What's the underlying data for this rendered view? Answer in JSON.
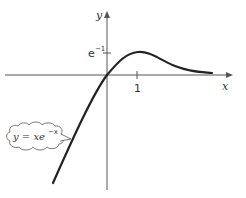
{
  "diagram": {
    "axes": {
      "x_label": "x",
      "y_label": "y",
      "x_tick_label": "1",
      "y_tick_label": "e",
      "y_tick_exponent": "−1"
    },
    "callout": {
      "text": "y = xe",
      "exponent": "−x"
    },
    "features": {
      "maximum_point": "(1, e^-1)",
      "passes_through": "origin",
      "asymptote": "y = 0 as x → ∞"
    },
    "colors": {
      "curve": "#222222",
      "axes": "#555555",
      "background": "#ffffff"
    }
  }
}
